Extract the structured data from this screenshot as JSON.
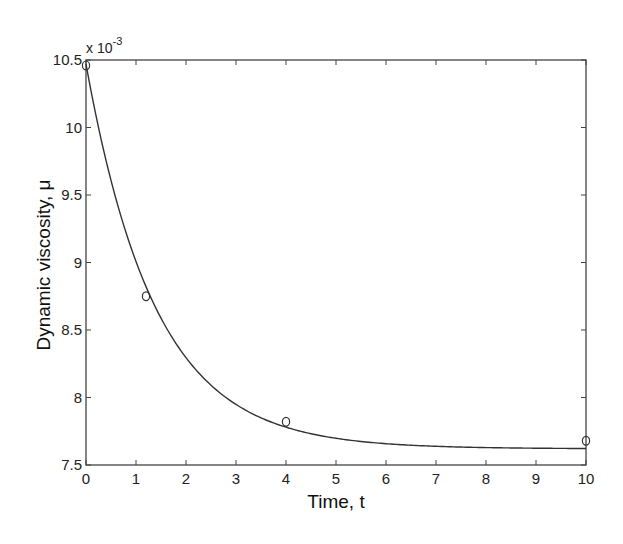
{
  "chart_data": {
    "type": "line",
    "title": "",
    "xlabel": "Time, t",
    "ylabel": "Dynamic viscosity, μ",
    "y_multiplier": "x 10",
    "y_multiplier_exponent": "-3",
    "xlim": [
      0,
      10
    ],
    "ylim": [
      7.5,
      10.5
    ],
    "x_ticks": [
      "0",
      "1",
      "2",
      "3",
      "4",
      "5",
      "6",
      "7",
      "8",
      "9",
      "10"
    ],
    "y_ticks": [
      "7.5",
      "8",
      "8.5",
      "9",
      "9.5",
      "10",
      "10.5"
    ],
    "grid": false,
    "legend": null,
    "series": [
      {
        "name": "fitted curve",
        "style": "solid line",
        "x": [
          0,
          0.5,
          1,
          1.5,
          2,
          2.5,
          3,
          3.5,
          4,
          5,
          6,
          7,
          8,
          9,
          10
        ],
        "y": [
          10.47,
          9.97,
          9.55,
          9.23,
          8.98,
          8.67,
          8.47,
          8.3,
          7.82,
          7.75,
          7.7,
          7.67,
          7.65,
          7.64,
          7.63
        ]
      },
      {
        "name": "measured data",
        "style": "open circle markers",
        "x": [
          0,
          1.2,
          4,
          10
        ],
        "y": [
          10.46,
          8.75,
          7.82,
          7.68
        ]
      }
    ]
  },
  "colors": {
    "line": "#333333",
    "axes": "#444444",
    "background": "#ffffff"
  }
}
